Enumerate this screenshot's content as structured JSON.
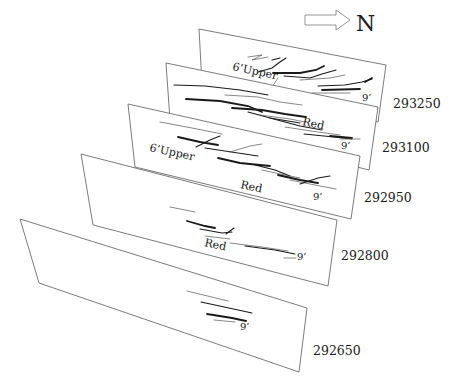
{
  "north_indicator": {
    "label": "N",
    "arrow": "hollow-arrow-right"
  },
  "sections": [
    {
      "id": "293250",
      "label": "293250",
      "corners": [
        [
          199,
          29
        ],
        [
          386,
          65
        ],
        [
          378,
          122
        ],
        [
          202,
          84
        ]
      ],
      "label_pos": [
        393,
        108
      ],
      "annotations": [
        {
          "text": "6’Upper",
          "x": 232,
          "y": 70,
          "rotate": 12,
          "size": 11
        },
        {
          "text": "9’",
          "x": 362,
          "y": 101,
          "rotate": 0,
          "size": 10
        }
      ]
    },
    {
      "id": "293100",
      "label": "293100",
      "corners": [
        [
          166,
          63
        ],
        [
          378,
          107
        ],
        [
          369,
          170
        ],
        [
          170,
          120
        ]
      ],
      "label_pos": [
        382,
        152
      ],
      "annotations": [
        {
          "text": "Red",
          "x": 302,
          "y": 125,
          "rotate": 12,
          "size": 11
        },
        {
          "text": "9’",
          "x": 341,
          "y": 149,
          "rotate": 0,
          "size": 10
        }
      ]
    },
    {
      "id": "292950",
      "label": "292950",
      "corners": [
        [
          128,
          104
        ],
        [
          360,
          156
        ],
        [
          351,
          219
        ],
        [
          135,
          167
        ]
      ],
      "label_pos": [
        364,
        202
      ],
      "annotations": [
        {
          "text": "6’Upper",
          "x": 149,
          "y": 151,
          "rotate": 12,
          "size": 11
        },
        {
          "text": "Red",
          "x": 240,
          "y": 188,
          "rotate": 12,
          "size": 11
        },
        {
          "text": "9’",
          "x": 313,
          "y": 200,
          "rotate": 0,
          "size": 10
        }
      ]
    },
    {
      "id": "292800",
      "label": "292800",
      "corners": [
        [
          81,
          154
        ],
        [
          337,
          220
        ],
        [
          328,
          286
        ],
        [
          93,
          225
        ]
      ],
      "label_pos": [
        341,
        260
      ],
      "annotations": [
        {
          "text": "Red",
          "x": 204,
          "y": 246,
          "rotate": 12,
          "size": 11
        },
        {
          "text": "9’",
          "x": 297,
          "y": 260,
          "rotate": 0,
          "size": 10
        }
      ]
    },
    {
      "id": "292650",
      "label": "292650",
      "corners": [
        [
          20,
          219
        ],
        [
          307,
          308
        ],
        [
          299,
          372
        ],
        [
          39,
          283
        ]
      ],
      "label_pos": [
        313,
        355
      ],
      "annotations": [
        {
          "text": "9’",
          "x": 240,
          "y": 330,
          "rotate": 0,
          "size": 10
        }
      ]
    }
  ],
  "chart_data": {
    "type": "diagram",
    "title": "",
    "orientation_label": "N",
    "section_labels": [
      "293250",
      "293100",
      "292950",
      "292800",
      "292650"
    ],
    "horizon_labels": [
      "6’Upper",
      "Red",
      "9’"
    ],
    "sections_with_horizons": {
      "293250": [
        "6’Upper",
        "9’"
      ],
      "293100": [
        "Red",
        "9’"
      ],
      "292950": [
        "6’Upper",
        "Red",
        "9’"
      ],
      "292800": [
        "Red",
        "9’"
      ],
      "292650": [
        "9’"
      ]
    }
  }
}
